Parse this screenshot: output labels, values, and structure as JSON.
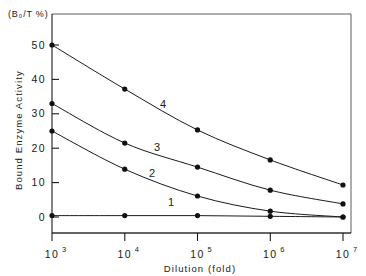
{
  "chart_data": {
    "type": "line",
    "title": "",
    "xlabel": "Dilution (fold)",
    "ylabel": "Bound Enzyme Activity",
    "y_unit_label": "(B₀/T %)",
    "x_scale": "log10",
    "x_tick_labels": [
      "10",
      "10",
      "10",
      "10",
      "10"
    ],
    "x_tick_exponents": [
      "3",
      "4",
      "5",
      "6",
      "7"
    ],
    "x_tick_values": [
      1000,
      10000,
      100000,
      1000000,
      10000000
    ],
    "xlim": [
      1000,
      10000000
    ],
    "y_tick_labels": [
      "0",
      "10",
      "20",
      "30",
      "40",
      "50"
    ],
    "y_tick_values": [
      0,
      10,
      20,
      30,
      40,
      50
    ],
    "ylim": [
      -1.5,
      52
    ],
    "grid": false,
    "legend": "inline-curve-numbers",
    "marker": "filled-circle",
    "x": [
      1000,
      10000,
      100000,
      1000000,
      10000000
    ],
    "series": [
      {
        "name": "1",
        "label": "1",
        "values": [
          0.4,
          0.4,
          0.4,
          0.2,
          0.0
        ]
      },
      {
        "name": "2",
        "label": "2",
        "values": [
          25.0,
          13.9,
          6.1,
          1.7,
          0.0
        ]
      },
      {
        "name": "3",
        "label": "3",
        "values": [
          33.0,
          21.5,
          14.5,
          7.8,
          3.8
        ]
      },
      {
        "name": "4",
        "label": "4",
        "values": [
          50.0,
          37.2,
          25.3,
          16.6,
          9.3
        ]
      }
    ],
    "annotations": [
      {
        "text": "4",
        "x_px": 163,
        "y_px": 108
      },
      {
        "text": "3",
        "x_px": 157,
        "y_px": 151
      },
      {
        "text": "2",
        "x_px": 152,
        "y_px": 177
      },
      {
        "text": "1",
        "x_px": 171,
        "y_px": 206
      }
    ],
    "colors": {
      "curve": "#1a1a1a",
      "marker": "#111111",
      "axis": "#1a1a1a",
      "frame": "#4a4a4a",
      "background": "#ffffff"
    }
  }
}
